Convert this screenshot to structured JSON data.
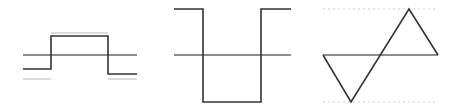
{
  "figure": {
    "colors": {
      "stroke": "#333333",
      "axis": "#666666",
      "reference": "#cfcfcf",
      "dotted": "#e0e0e0",
      "background": "#ffffff"
    },
    "panels": [
      {
        "name": "pulse-waveform",
        "axis": {
          "x1": 23,
          "y1": 55,
          "x2": 137,
          "y2": 55
        },
        "waveform": "23,69 51,69 51,36 108,36 108,74 137,74",
        "references": [
          {
            "x1": 51,
            "y1": 33,
            "x2": 108,
            "y2": 33
          },
          {
            "x1": 23,
            "y1": 79,
            "x2": 51,
            "y2": 79
          },
          {
            "x1": 108,
            "y1": 79,
            "x2": 137,
            "y2": 79
          }
        ]
      },
      {
        "name": "inverted-pulse-waveform",
        "axis": {
          "x1": 174,
          "y1": 55,
          "x2": 291,
          "y2": 55
        },
        "waveform": "174,9 203,9 203,102 261,102 261,9 291,9"
      },
      {
        "name": "triangle-waveform",
        "axis": {
          "x1": 323,
          "y1": 55,
          "x2": 438,
          "y2": 55
        },
        "waveform": "323,55 351,102 409,9 438,55",
        "dotted_guides": [
          {
            "x1": 323,
            "y1": 9,
            "x2": 438,
            "y2": 9
          },
          {
            "x1": 323,
            "y1": 102,
            "x2": 438,
            "y2": 102
          }
        ]
      }
    ]
  }
}
